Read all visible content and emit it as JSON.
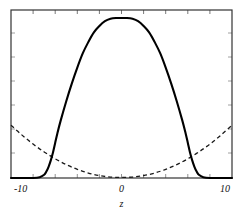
{
  "chart_data": {
    "type": "line",
    "title": "",
    "subtitle": "",
    "xlabel": "z",
    "ylabel": "",
    "xlim": [
      -10,
      10
    ],
    "ylim": [
      0,
      1.05
    ],
    "grid": false,
    "legend": "none",
    "xticks": [
      -10,
      0,
      10
    ],
    "xticklabels": [
      "-10",
      "0",
      "10"
    ],
    "yticks": [],
    "yticklabels": [],
    "minor_xticks": [
      -10,
      -8,
      -6,
      -4,
      -2,
      0,
      2,
      4,
      6,
      8,
      10
    ],
    "frame": "box",
    "series": [
      {
        "name": "solid-curve",
        "style": "solid",
        "color": "#000000",
        "linewidth": 2,
        "description": "compact-support bell, zero outside |z|>7, peak 1.0 at z=0",
        "x": [
          -10,
          -9,
          -8,
          -7.4,
          -7,
          -6.8,
          -6.6,
          -6.4,
          -6.2,
          -6,
          -5.8,
          -5.5,
          -5,
          -4.5,
          -4,
          -3.5,
          -3,
          -2.5,
          -2,
          -1.5,
          -1,
          -0.5,
          0,
          0.5,
          1,
          1.5,
          2,
          2.5,
          3,
          3.5,
          4,
          4.5,
          5,
          5.5,
          5.8,
          6,
          6.2,
          6.4,
          6.6,
          6.8,
          7,
          7.4,
          8,
          9,
          10
        ],
        "y": [
          0,
          0,
          0,
          0.005,
          0.02,
          0.04,
          0.07,
          0.11,
          0.16,
          0.22,
          0.28,
          0.36,
          0.48,
          0.59,
          0.69,
          0.78,
          0.85,
          0.91,
          0.95,
          0.98,
          0.995,
          1.0,
          1.0,
          1.0,
          0.995,
          0.98,
          0.95,
          0.91,
          0.85,
          0.78,
          0.69,
          0.59,
          0.48,
          0.36,
          0.28,
          0.22,
          0.16,
          0.11,
          0.07,
          0.04,
          0.02,
          0.005,
          0,
          0,
          0
        ]
      },
      {
        "name": "dashed-curve",
        "style": "dashed",
        "color": "#1a1a1a",
        "linewidth": 1,
        "description": "upward parabola, minimum ~0.01 at z=0, ~0.33 at |z|=10",
        "x": [
          -10,
          -9,
          -8,
          -7,
          -6,
          -5,
          -4,
          -3,
          -2,
          -1,
          0,
          1,
          2,
          3,
          4,
          5,
          6,
          7,
          8,
          9,
          10
        ],
        "y": [
          0.33,
          0.268,
          0.212,
          0.163,
          0.12,
          0.084,
          0.054,
          0.031,
          0.015,
          0.006,
          0.004,
          0.006,
          0.015,
          0.031,
          0.054,
          0.084,
          0.12,
          0.163,
          0.212,
          0.268,
          0.33
        ]
      }
    ]
  },
  "axis": {
    "x_title": "z",
    "label_left": "-10",
    "label_center": "0",
    "label_right": "10"
  }
}
